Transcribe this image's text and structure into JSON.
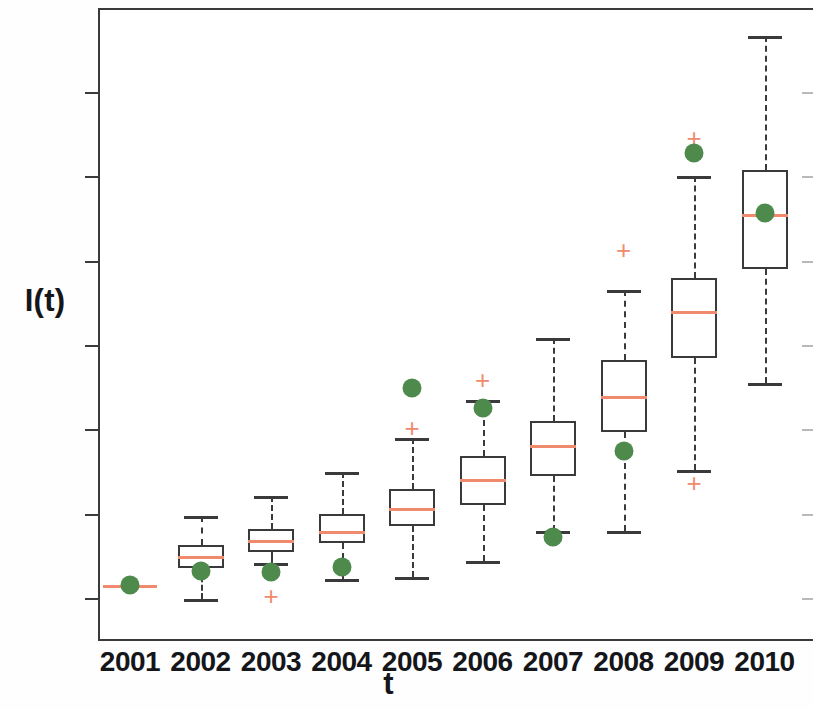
{
  "chart_data": {
    "type": "box",
    "title": "",
    "xlabel": "t",
    "ylabel": "I(t)",
    "categories": [
      "2001",
      "2002",
      "2003",
      "2004",
      "2005",
      "2006",
      "2007",
      "2008",
      "2009",
      "2010"
    ],
    "ytick_labels": [
      "0",
      "100",
      "200",
      "300",
      "400",
      "500",
      "600"
    ],
    "ytick_values": [
      0,
      100,
      200,
      300,
      400,
      500,
      600
    ],
    "ylim": [
      -30,
      680
    ],
    "xlim": [
      2000.5,
      2010.6
    ],
    "grid": false,
    "legend": null,
    "series": [
      {
        "name": "Simulated distribution (box-and-whisker)",
        "box_color": "#3a3a3c",
        "median_color": "#ef8a6d",
        "outlier_color": "#ef8a6d",
        "boxes": [
          {
            "x": "2001",
            "whisker_low": 14,
            "q1": 14,
            "median": 15,
            "q3": 16,
            "whisker_high": 16,
            "outliers": []
          },
          {
            "x": "2002",
            "whisker_low": -1,
            "q1": 35,
            "median": 50,
            "q3": 63,
            "whisker_high": 97,
            "outliers": []
          },
          {
            "x": "2003",
            "whisker_low": 42,
            "q1": 55,
            "median": 69,
            "q3": 82,
            "whisker_high": 121,
            "outliers": [
              2
            ]
          },
          {
            "x": "2004",
            "whisker_low": 22,
            "q1": 65,
            "median": 80,
            "q3": 100,
            "whisker_high": 150,
            "outliers": []
          },
          {
            "x": "2005",
            "whisker_low": 25,
            "q1": 85,
            "median": 107,
            "q3": 129,
            "whisker_high": 190,
            "outliers": [
              202
            ]
          },
          {
            "x": "2006",
            "whisker_low": 44,
            "q1": 110,
            "median": 141,
            "q3": 168,
            "whisker_high": 235,
            "outliers": [
              258
            ]
          },
          {
            "x": "2007",
            "whisker_low": 79,
            "q1": 145,
            "median": 181,
            "q3": 210,
            "whisker_high": 308,
            "outliers": []
          },
          {
            "x": "2008",
            "whisker_low": 80,
            "q1": 197,
            "median": 239,
            "q3": 282,
            "whisker_high": 365,
            "outliers": [
              413
            ]
          },
          {
            "x": "2009",
            "whisker_low": 152,
            "q1": 285,
            "median": 340,
            "q3": 379,
            "whisker_high": 501,
            "outliers": [
              136,
              546
            ]
          },
          {
            "x": "2010",
            "whisker_low": 255,
            "q1": 390,
            "median": 455,
            "q3": 507,
            "whisker_high": 667,
            "outliers": []
          }
        ]
      },
      {
        "name": "Observed value",
        "marker": "filled-circle",
        "marker_color": "#4e8a4c",
        "points": [
          {
            "x": "2001",
            "y": 15
          },
          {
            "x": "2002",
            "y": 32
          },
          {
            "x": "2003",
            "y": 31
          },
          {
            "x": "2004",
            "y": 37
          },
          {
            "x": "2005",
            "y": 249
          },
          {
            "x": "2006",
            "y": 225
          },
          {
            "x": "2007",
            "y": 72
          },
          {
            "x": "2008",
            "y": 174
          },
          {
            "x": "2009",
            "y": 528
          },
          {
            "x": "2010",
            "y": 456
          }
        ]
      }
    ]
  },
  "axes": {
    "y_axis_title": "I(t)",
    "x_axis_title": "t"
  }
}
